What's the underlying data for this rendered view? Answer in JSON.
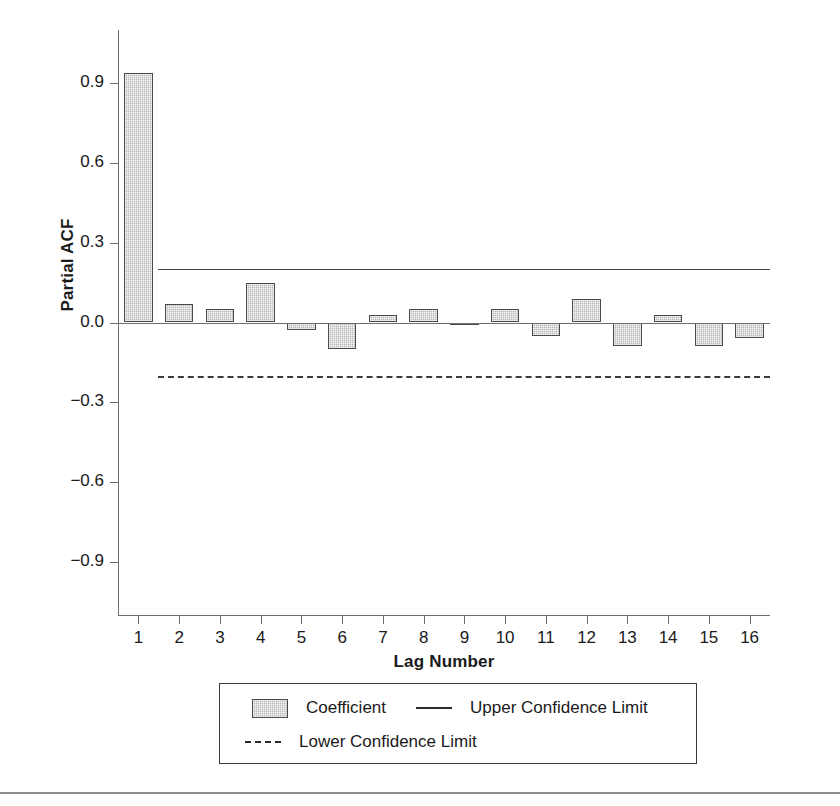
{
  "chart_data": {
    "type": "bar",
    "title": "",
    "xlabel": "Lag Number",
    "ylabel": "Partial ACF",
    "categories": [
      1,
      2,
      3,
      4,
      5,
      6,
      7,
      8,
      9,
      10,
      11,
      12,
      13,
      14,
      15,
      16
    ],
    "values": [
      0.94,
      0.07,
      0.05,
      0.15,
      -0.03,
      -0.1,
      0.03,
      0.05,
      -0.01,
      0.05,
      -0.05,
      0.09,
      -0.09,
      0.03,
      -0.09,
      -0.06
    ],
    "series": [
      {
        "name": "Coefficient",
        "values": [
          0.94,
          0.07,
          0.05,
          0.15,
          -0.03,
          -0.1,
          0.03,
          0.05,
          -0.01,
          0.05,
          -0.05,
          0.09,
          -0.09,
          0.03,
          -0.09,
          -0.06
        ]
      }
    ],
    "reference_lines": [
      {
        "name": "Upper Confidence Limit",
        "value": 0.2,
        "style": "solid"
      },
      {
        "name": "Lower Confidence Limit",
        "value": -0.2,
        "style": "dashed"
      }
    ],
    "ylim": [
      -1.1,
      1.1
    ],
    "yticks": [
      0.9,
      0.6,
      0.3,
      0.0,
      -0.3,
      -0.6,
      -0.9
    ],
    "ytick_labels": [
      "0.9",
      "0.6",
      "0.3",
      "0.0",
      "−0.3",
      "−0.6",
      "−0.9"
    ],
    "xtick_labels": [
      "1",
      "2",
      "3",
      "4",
      "5",
      "6",
      "7",
      "8",
      "9",
      "10",
      "11",
      "12",
      "13",
      "14",
      "15",
      "16"
    ],
    "grid": false,
    "legend_position": "bottom",
    "bar_fill_color": "#b8b8b8",
    "bar_edge_color": "#4a4a4a",
    "axis_color": "#6e6e6e"
  },
  "axes": {
    "y_title": "Partial ACF",
    "x_title": "Lag Number"
  },
  "legend": {
    "entries": [
      {
        "label": "Coefficient",
        "marker": "filled-square-swatch"
      },
      {
        "label": "Upper Confidence Limit",
        "marker": "solid-line-swatch"
      },
      {
        "label": "Lower Confidence Limit",
        "marker": "dashed-line-swatch"
      }
    ]
  }
}
